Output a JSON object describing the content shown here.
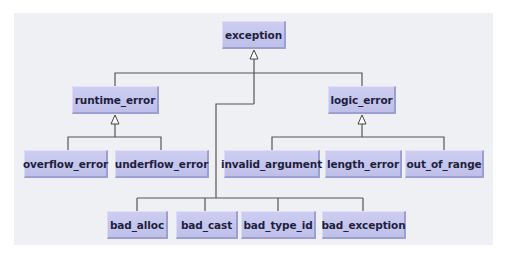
{
  "diagram": {
    "type": "class-hierarchy",
    "colors": {
      "node_fill": "#c4c5ee",
      "node_text": "#1e1f3d",
      "line": "#555555",
      "panel": "#eef0f3"
    },
    "nodes": {
      "exception": "exception",
      "runtime_error": "runtime_error",
      "logic_error": "logic_error",
      "overflow_error": "overflow_error",
      "underflow_error": "underflow_error",
      "invalid_argument": "invalid_argument",
      "length_error": "length_error",
      "out_of_range": "out_of_range",
      "bad_alloc": "bad_alloc",
      "bad_cast": "bad_cast",
      "bad_type_id": "bad_type_id",
      "bad_exception": "bad_exception"
    },
    "edges": [
      {
        "from": "runtime_error",
        "to": "exception"
      },
      {
        "from": "logic_error",
        "to": "exception"
      },
      {
        "from": "bad_alloc",
        "to": "exception"
      },
      {
        "from": "bad_cast",
        "to": "exception"
      },
      {
        "from": "bad_type_id",
        "to": "exception"
      },
      {
        "from": "bad_exception",
        "to": "exception"
      },
      {
        "from": "overflow_error",
        "to": "runtime_error"
      },
      {
        "from": "underflow_error",
        "to": "runtime_error"
      },
      {
        "from": "invalid_argument",
        "to": "logic_error"
      },
      {
        "from": "length_error",
        "to": "logic_error"
      },
      {
        "from": "out_of_range",
        "to": "logic_error"
      }
    ]
  }
}
